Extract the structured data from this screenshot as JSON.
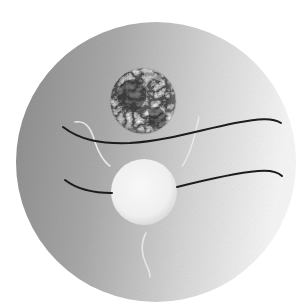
{
  "figure": {
    "description": "Grayscale illustration: a large shaded disc containing a textured Earth sphere above a bright white sphere, crossed by two dark wavy lines, with faint light curved threads.",
    "colors": {
      "background": "#ffffff",
      "disc_dark": "#8a8a8a",
      "disc_mid": "#b4b4b4",
      "disc_light": "#f2f2f2",
      "earth_dark": "#2e2e2e",
      "earth_mid": "#6a6a6a",
      "earth_light": "#b8b8b8",
      "white_sphere_center": "#f7f7f7",
      "white_sphere_edge": "#dcdcdc",
      "dark_line": "#1c1c1c",
      "light_thread": "#e6e6e6"
    },
    "shapes": {
      "disc": {
        "cx": 156,
        "cy": 162,
        "r": 140
      },
      "earth": {
        "cx": 143,
        "cy": 101,
        "r": 33
      },
      "white_sphere": {
        "cx": 144,
        "cy": 192,
        "r": 33
      }
    },
    "paths": {
      "upper_dark_line": "M63,127 C80,140 100,144 130,143 C165,141 200,130 235,123 C258,119 272,117 281,123",
      "lower_dark_line_left": "M65,180 C78,190 95,193 112,193",
      "lower_dark_line_right": "M177,187 C205,180 235,173 258,171 C270,170 277,171 282,176",
      "left_thread": "M75,122 C88,120 92,132 95,142 C98,152 104,162 110,166",
      "right_thread": "M199,117 C196,130 193,145 188,155 C186,160 184,164 182,166",
      "bottom_thread": "M146,233 C140,244 142,256 146,264 C149,270 150,274 150,277"
    }
  }
}
